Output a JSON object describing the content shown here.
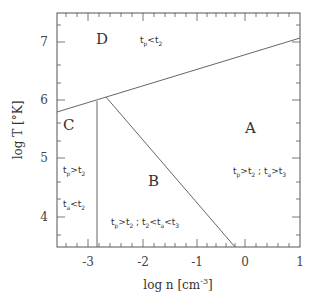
{
  "diagram": {
    "xaxis": {
      "label": "log n [cm",
      "label_sup": "-3",
      "label_close": "]",
      "ticks": [
        "-3",
        "-2",
        "-1",
        "0",
        "1"
      ],
      "range": [
        -3.55,
        1.0
      ]
    },
    "yaxis": {
      "label": "log T [°K]",
      "ticks": [
        "4",
        "5",
        "6",
        "7"
      ],
      "range": [
        3.5,
        7.5
      ]
    },
    "regions": {
      "A": "A",
      "B": "B",
      "C": "C",
      "D": "D"
    },
    "conditions": {
      "D": {
        "a": "t",
        "a_sub": "p",
        "op": "<",
        "b": "t",
        "b_sub": "2"
      },
      "C1": {
        "a": "t",
        "a_sub": "p",
        "op": ">",
        "b": "t",
        "b_sub": "2"
      },
      "C2": {
        "a": "t",
        "a_sub": "a",
        "op": "<",
        "b": "t",
        "b_sub": "2"
      },
      "B": {
        "text1": "t",
        "s1": "p",
        "op1": ">",
        "text2": "t",
        "s2": "2",
        "sep": " ; ",
        "text3": "t",
        "s3": "2",
        "op2": "<",
        "text4": "t",
        "s4": "a",
        "op3": "<",
        "text5": "t",
        "s5": "3"
      },
      "A": {
        "text1": "t",
        "s1": "p",
        "op1": ">",
        "text2": "t",
        "s2": "2",
        "sep": " ; ",
        "text3": "t",
        "s3": "a",
        "op2": ">",
        "text4": "t",
        "s4": "3"
      }
    },
    "boundaries": [
      {
        "name": "upper",
        "from": [
          -3.55,
          5.82
        ],
        "to": [
          1.0,
          7.08
        ]
      },
      {
        "name": "vertical",
        "from": [
          -2.75,
          6.02
        ],
        "to": [
          -2.75,
          3.5
        ]
      },
      {
        "name": "diagonal",
        "from": [
          -2.58,
          6.07
        ],
        "to": [
          -0.2,
          3.5
        ]
      }
    ]
  }
}
